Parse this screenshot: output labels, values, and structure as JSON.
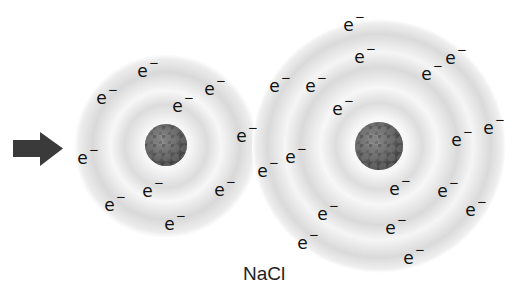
{
  "diagram": {
    "label": "NaCl",
    "arrow": {
      "direction": "right",
      "color": "#3a3a3a"
    },
    "electron_symbol": "e",
    "electron_charge": "−",
    "atoms": [
      {
        "name": "sodium-atom",
        "center": [
          166,
          146
        ],
        "outer_radius": 92,
        "nucleus_radius": 21,
        "electron_count": 11,
        "electrons": [
          [
            148,
            70
          ],
          [
            215,
            88
          ],
          [
            107,
            97
          ],
          [
            183,
            105
          ],
          [
            247,
            135
          ],
          [
            88,
            157
          ],
          [
            153,
            190
          ],
          [
            225,
            189
          ],
          [
            115,
            204
          ],
          [
            175,
            223
          ]
        ]
      },
      {
        "name": "chlorine-atom",
        "center": [
          379,
          146
        ],
        "outer_radius": 127,
        "nucleus_radius": 24,
        "electron_count": 18,
        "electrons": [
          [
            354,
            24
          ],
          [
            365,
            56
          ],
          [
            456,
            57
          ],
          [
            432,
            73
          ],
          [
            280,
            85
          ],
          [
            316,
            85
          ],
          [
            343,
            108
          ],
          [
            494,
            127
          ],
          [
            462,
            139
          ],
          [
            296,
            156
          ],
          [
            268,
            170
          ],
          [
            400,
            188
          ],
          [
            448,
            190
          ],
          [
            476,
            209
          ],
          [
            328,
            213
          ],
          [
            396,
            227
          ],
          [
            308,
            242
          ],
          [
            414,
            257
          ]
        ]
      }
    ],
    "colors": {
      "background": "#ffffff",
      "shell_gray": "#d9d9d9",
      "nucleus_dark": "#4a4a4a",
      "nucleus_light": "#8a8a8a",
      "text": "#111111"
    }
  }
}
